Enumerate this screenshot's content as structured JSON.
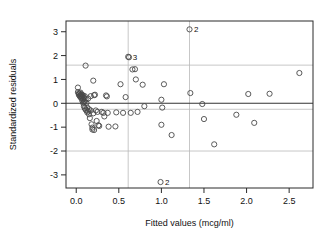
{
  "chart_data": {
    "type": "scatter",
    "title": "",
    "xlabel": "Fitted values (mcg/ml)",
    "ylabel": "Standardized residuals",
    "xlim": [
      -0.12,
      2.78
    ],
    "ylim": [
      -3.55,
      3.45
    ],
    "xticks": [
      0.0,
      0.5,
      1.0,
      1.5,
      2.0,
      2.5
    ],
    "xticklabels": [
      "0.0",
      "0.5",
      "1.0",
      "1.5",
      "2.0",
      "2.5"
    ],
    "yticks": [
      -3,
      -2,
      -1,
      0,
      1,
      2,
      3
    ],
    "yticklabels": [
      "-3",
      "-2",
      "-1",
      "0",
      "1",
      "2",
      "3"
    ],
    "grid": true,
    "gridlines_x": [
      0.61,
      1.33
    ],
    "gridlines_y": [
      1.6,
      -0.25,
      -2.0
    ],
    "reference_line_y": 0,
    "marker": "open-circle",
    "marker_color": "#4a4a4a",
    "points": [
      {
        "x": 0.02,
        "y": 0.66
      },
      {
        "x": 0.02,
        "y": 0.47
      },
      {
        "x": 0.03,
        "y": 0.42
      },
      {
        "x": 0.03,
        "y": 0.36
      },
      {
        "x": 0.04,
        "y": 0.4
      },
      {
        "x": 0.04,
        "y": 0.31
      },
      {
        "x": 0.05,
        "y": 0.45
      },
      {
        "x": 0.05,
        "y": 0.33
      },
      {
        "x": 0.05,
        "y": 0.26
      },
      {
        "x": 0.06,
        "y": 0.38
      },
      {
        "x": 0.06,
        "y": 0.3
      },
      {
        "x": 0.06,
        "y": 0.22
      },
      {
        "x": 0.07,
        "y": 0.35
      },
      {
        "x": 0.07,
        "y": 0.28
      },
      {
        "x": 0.07,
        "y": 0.12
      },
      {
        "x": 0.08,
        "y": 0.33
      },
      {
        "x": 0.08,
        "y": 0.18
      },
      {
        "x": 0.08,
        "y": 0.02
      },
      {
        "x": 0.09,
        "y": 0.24
      },
      {
        "x": 0.09,
        "y": 0.05
      },
      {
        "x": 0.09,
        "y": -0.12
      },
      {
        "x": 0.1,
        "y": 0.3
      },
      {
        "x": 0.1,
        "y": 0.08
      },
      {
        "x": 0.1,
        "y": -0.2
      },
      {
        "x": 0.11,
        "y": 1.58
      },
      {
        "x": 0.11,
        "y": 0.16
      },
      {
        "x": 0.11,
        "y": -0.26
      },
      {
        "x": 0.12,
        "y": 0.02
      },
      {
        "x": 0.12,
        "y": -0.3
      },
      {
        "x": 0.13,
        "y": -0.18
      },
      {
        "x": 0.13,
        "y": -0.38
      },
      {
        "x": 0.14,
        "y": 0.2
      },
      {
        "x": 0.14,
        "y": -0.34
      },
      {
        "x": 0.15,
        "y": -0.25
      },
      {
        "x": 0.15,
        "y": -0.46
      },
      {
        "x": 0.16,
        "y": -0.62
      },
      {
        "x": 0.17,
        "y": 0.3
      },
      {
        "x": 0.17,
        "y": -0.3
      },
      {
        "x": 0.18,
        "y": -0.88
      },
      {
        "x": 0.19,
        "y": -1.02
      },
      {
        "x": 0.19,
        "y": -1.1
      },
      {
        "x": 0.2,
        "y": 0.95
      },
      {
        "x": 0.2,
        "y": -0.42
      },
      {
        "x": 0.21,
        "y": 0.34
      },
      {
        "x": 0.21,
        "y": -1.12
      },
      {
        "x": 0.22,
        "y": 0.36
      },
      {
        "x": 0.23,
        "y": -0.3
      },
      {
        "x": 0.24,
        "y": -0.74
      },
      {
        "x": 0.25,
        "y": -0.36
      },
      {
        "x": 0.26,
        "y": -0.92
      },
      {
        "x": 0.27,
        "y": -0.95
      },
      {
        "x": 0.3,
        "y": -0.36
      },
      {
        "x": 0.32,
        "y": -0.4
      },
      {
        "x": 0.33,
        "y": -0.55
      },
      {
        "x": 0.35,
        "y": 0.33
      },
      {
        "x": 0.36,
        "y": 0.29
      },
      {
        "x": 0.37,
        "y": -0.4
      },
      {
        "x": 0.38,
        "y": -0.98
      },
      {
        "x": 0.46,
        "y": -0.97
      },
      {
        "x": 0.47,
        "y": -0.38
      },
      {
        "x": 0.52,
        "y": 0.8
      },
      {
        "x": 0.55,
        "y": -0.4
      },
      {
        "x": 0.58,
        "y": 0.26
      },
      {
        "x": 0.61,
        "y": 1.95
      },
      {
        "x": 0.62,
        "y": 1.93
      },
      {
        "x": 0.64,
        "y": -0.4
      },
      {
        "x": 0.66,
        "y": 1.42
      },
      {
        "x": 0.69,
        "y": 1.43
      },
      {
        "x": 0.7,
        "y": 1.0
      },
      {
        "x": 0.72,
        "y": -0.36
      },
      {
        "x": 0.78,
        "y": 0.78
      },
      {
        "x": 0.8,
        "y": -0.12
      },
      {
        "x": 1.0,
        "y": 0.15
      },
      {
        "x": 1.0,
        "y": -0.9
      },
      {
        "x": 1.01,
        "y": -0.18
      },
      {
        "x": 1.03,
        "y": 0.8
      },
      {
        "x": 1.12,
        "y": -1.33
      },
      {
        "x": 1.33,
        "y": 3.1
      },
      {
        "x": 1.34,
        "y": 0.43
      },
      {
        "x": 1.48,
        "y": -0.03
      },
      {
        "x": 1.5,
        "y": -0.66
      },
      {
        "x": 1.62,
        "y": -1.72
      },
      {
        "x": 1.88,
        "y": -0.48
      },
      {
        "x": 2.02,
        "y": 0.39
      },
      {
        "x": 2.09,
        "y": -0.82
      },
      {
        "x": 2.27,
        "y": 0.4
      },
      {
        "x": 2.62,
        "y": 1.27
      },
      {
        "x": 0.99,
        "y": -3.3
      }
    ],
    "annotations": [
      {
        "label": "2",
        "x": 1.33,
        "y": 3.1
      },
      {
        "label": "3",
        "x": 0.61,
        "y": 1.95
      },
      {
        "label": "2",
        "x": 0.99,
        "y": -3.3
      }
    ]
  }
}
